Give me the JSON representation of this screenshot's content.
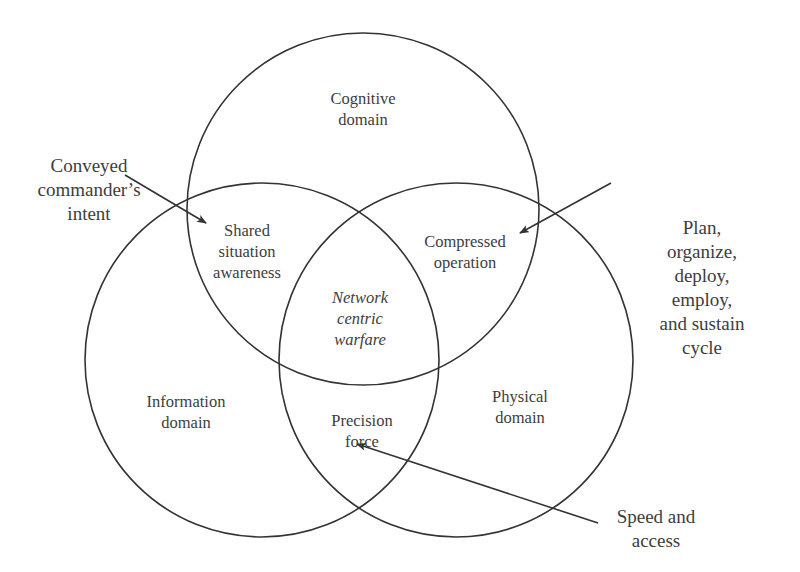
{
  "diagram": {
    "colors": {
      "stroke": "#333333",
      "text": "#3d3d3d",
      "background": "#ffffff"
    },
    "circles": [
      {
        "id": "cognitive",
        "label": "Cognitive\ndomain",
        "cx": 363,
        "cy": 209,
        "r": 176
      },
      {
        "id": "information",
        "label": "Information\ndomain",
        "cx": 262,
        "cy": 360,
        "r": 177
      },
      {
        "id": "physical",
        "label": "Physical\ndomain",
        "cx": 456,
        "cy": 360,
        "r": 177
      }
    ],
    "intersections": {
      "cognitive_information": "Shared\nsituation\nawareness",
      "cognitive_physical": "Compressed\noperation",
      "information_physical": "Precision\nforce",
      "all_three": "Network\ncentric\nwarfare"
    },
    "annotations": [
      {
        "id": "conveyed",
        "text": "Conveyed\ncommander’s\nintent",
        "arrow_from": [
          125,
          175
        ],
        "arrow_to": [
          206,
          223
        ]
      },
      {
        "id": "plan",
        "text": "Plan, organize,\ndeploy, employ,\nand sustain cycle",
        "arrow_from": [
          611,
          183
        ],
        "arrow_to": [
          520,
          233
        ]
      },
      {
        "id": "speed",
        "text": "Speed and\naccess",
        "arrow_from": [
          598,
          523
        ],
        "arrow_to": [
          357,
          444
        ]
      }
    ]
  }
}
